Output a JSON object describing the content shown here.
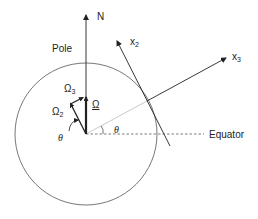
{
  "diagram": {
    "labels": {
      "north": "N",
      "pole": "Pole",
      "omega": "Ω",
      "omega2_base": "Ω",
      "omega2_sub": "2",
      "omega3_base": "Ω",
      "omega3_sub": "3",
      "theta_left": "θ",
      "theta_center": "θ",
      "equator": "Equator",
      "x2_base": "x",
      "x2_sub": "2",
      "x3_base": "x",
      "x3_sub": "3"
    },
    "colors": {
      "stroke": "#333333",
      "light_line": "#bbbbbb",
      "background": "#ffffff"
    },
    "elements": [
      "earth-circle",
      "north-axis-arrow",
      "omega-vector",
      "omega2-vector",
      "omega3-vector",
      "equator-dashed-line",
      "radius-line",
      "x3-axis-arrow",
      "x2-axis-arrow",
      "theta-angle-arcs"
    ]
  }
}
